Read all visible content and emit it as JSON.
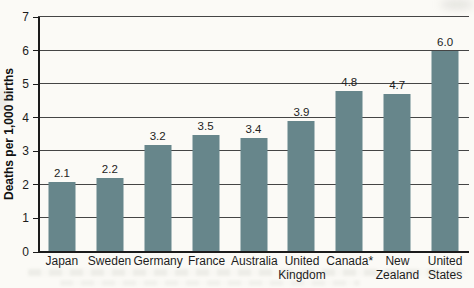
{
  "chart_data": {
    "type": "bar",
    "categories": [
      "Japan",
      "Sweden",
      "Germany",
      "France",
      "Australia",
      "United Kingdom",
      "Canada*",
      "New Zealand",
      "United States"
    ],
    "values": [
      2.1,
      2.2,
      3.2,
      3.5,
      3.4,
      3.9,
      4.8,
      4.7,
      6.0
    ],
    "value_labels": [
      "2.1",
      "2.2",
      "3.2",
      "3.5",
      "3.4",
      "3.9",
      "4.8",
      "4.7",
      "6.0"
    ],
    "title": "",
    "xlabel": "",
    "ylabel": "Deaths per 1,000 births",
    "ylim": [
      0,
      7
    ],
    "yticks": [
      0,
      1,
      2,
      3,
      4,
      5,
      6,
      7
    ],
    "grid": true,
    "legend": false,
    "colors": {
      "bar": "#67868b",
      "gridline": "#454545",
      "axis": "#1b1b1b",
      "value_label": "#222222",
      "tick_label": "#1c1c1c",
      "background": "#fbfaf6"
    }
  }
}
